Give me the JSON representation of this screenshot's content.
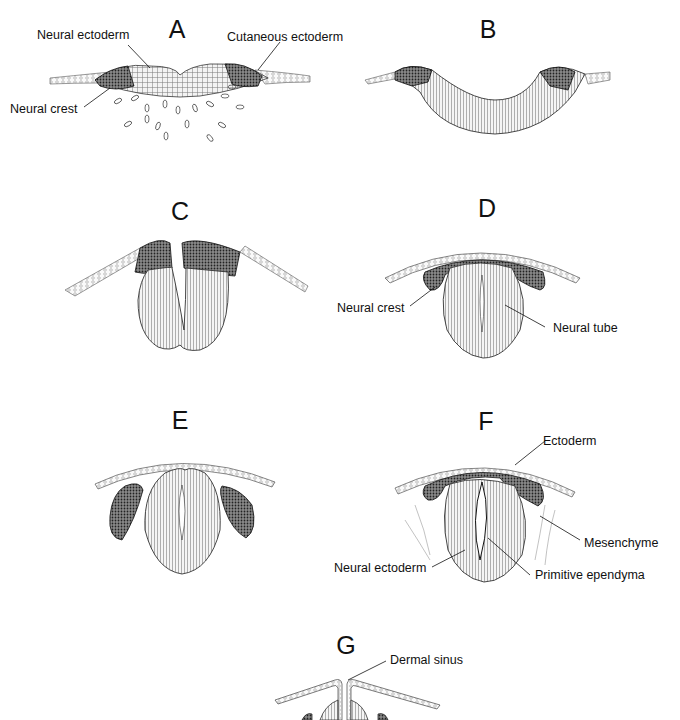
{
  "figure": {
    "panels": [
      {
        "id": "A",
        "letter": "A",
        "labels": [
          "Neural ectoderm",
          "Cutaneous ectoderm",
          "Neural crest"
        ]
      },
      {
        "id": "B",
        "letter": "B",
        "labels": []
      },
      {
        "id": "C",
        "letter": "C",
        "labels": []
      },
      {
        "id": "D",
        "letter": "D",
        "labels": [
          "Neural crest",
          "Neural tube"
        ]
      },
      {
        "id": "E",
        "letter": "E",
        "labels": []
      },
      {
        "id": "F",
        "letter": "F",
        "labels": [
          "Ectoderm",
          "Mesenchyme",
          "Neural ectoderm",
          "Primitive ependyma"
        ]
      },
      {
        "id": "G",
        "letter": "G",
        "labels": [
          "Dermal sinus"
        ]
      }
    ]
  },
  "A": {
    "letter": "A",
    "neural_ectoderm": "Neural ectoderm",
    "cutaneous_ectoderm": "Cutaneous ectoderm",
    "neural_crest": "Neural crest"
  },
  "B": {
    "letter": "B"
  },
  "C": {
    "letter": "C"
  },
  "D": {
    "letter": "D",
    "neural_crest": "Neural crest",
    "neural_tube": "Neural tube"
  },
  "E": {
    "letter": "E"
  },
  "F": {
    "letter": "F",
    "ectoderm": "Ectoderm",
    "mesenchyme": "Mesenchyme",
    "neural_ectoderm": "Neural ectoderm",
    "primitive_ependyma": "Primitive ependyma"
  },
  "G": {
    "letter": "G",
    "dermal_sinus": "Dermal sinus"
  },
  "colors": {
    "ink": "#111111",
    "crest_fill": "#6a6a6a",
    "tissue_fill": "#e9e9e9",
    "skin_fill": "#f4f4f4"
  }
}
